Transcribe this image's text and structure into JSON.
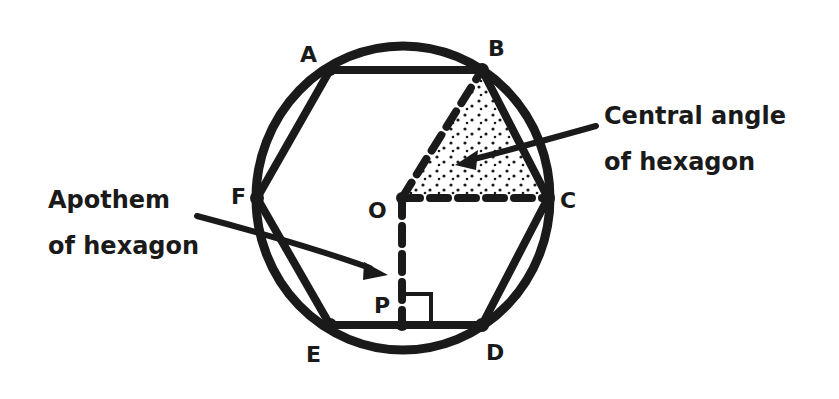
{
  "figure": {
    "vertices": {
      "A": "A",
      "B": "B",
      "C": "C",
      "D": "D",
      "E": "E",
      "F": "F",
      "O": "O",
      "P": "P"
    },
    "callouts": {
      "central_angle_line1": "Central angle",
      "central_angle_line2": "of hexagon",
      "apothem_line1": "Apothem",
      "apothem_line2": "of hexagon"
    },
    "colors": {
      "stroke": "#1a1a1a",
      "background": "#ffffff",
      "stipple": "#1a1a1a"
    }
  }
}
